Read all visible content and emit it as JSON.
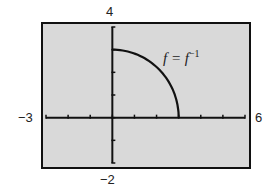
{
  "chart_data": {
    "type": "line",
    "title": "",
    "xlabel": "",
    "ylabel": "",
    "xlim": [
      -3,
      6
    ],
    "ylim": [
      -2,
      4
    ],
    "grid": false,
    "window_labels": {
      "xmin": "−3",
      "xmax": "6",
      "ymin": "−2",
      "ymax": "4"
    },
    "annotation": {
      "text": "f = f",
      "superscript": "−1"
    },
    "series": [
      {
        "name": "f = f^-1",
        "description": "quarter circle x^2 + y^2 = 9, x >= 0, y >= 0",
        "x": [
          0,
          0.5,
          1,
          1.5,
          2,
          2.5,
          2.8,
          3
        ],
        "y": [
          3,
          2.96,
          2.83,
          2.6,
          2.24,
          1.66,
          1.08,
          0
        ]
      }
    ],
    "x_ticks": [
      -3,
      -2,
      -1,
      0,
      1,
      2,
      3,
      4,
      5,
      6
    ],
    "y_ticks": [
      -2,
      -1,
      0,
      1,
      2,
      3,
      4
    ]
  },
  "colors": {
    "background": "#d9d9d9",
    "axis": "#111111",
    "curve": "#111111"
  }
}
